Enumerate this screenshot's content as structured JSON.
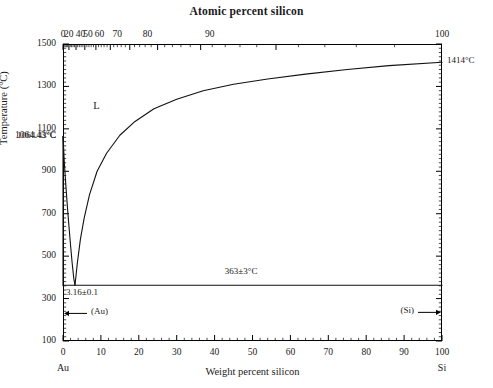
{
  "figure": {
    "title_top": "Atomic percent silicon",
    "title_bottom": "Weight percent silicon",
    "y_axis_title": "Temperature (°C)",
    "left_component": "Au",
    "right_component": "Si"
  },
  "annotations": {
    "liquid_phase": "L",
    "au_melting_point": "1064.43°C",
    "si_melting_point": "1414°C",
    "eutectic_temperature": "363±3°C",
    "eutectic_composition": "3.16±0.1",
    "au_solid_phase": "(Au)",
    "si_solid_phase": "(Si)"
  },
  "axes": {
    "y_ticks": [
      "100",
      "300",
      "500",
      "700",
      "900",
      "1100",
      "1300",
      "1500"
    ],
    "y_special_label": "1064.43°C",
    "y_min": 100,
    "y_max": 1500,
    "x_bottom_ticks": [
      "0",
      "10",
      "20",
      "30",
      "40",
      "50",
      "60",
      "70",
      "80",
      "90",
      "100"
    ],
    "x_bottom_min": 0,
    "x_bottom_max": 100,
    "x_top_ticks": [
      "0",
      "20",
      "40",
      "50",
      "60",
      "70",
      "80",
      "90",
      "100"
    ],
    "x_top_tick_weightpct": [
      0,
      1.5,
      4.6,
      6.6,
      9.6,
      14.3,
      22.3,
      38.7,
      100
    ]
  },
  "chart_data": {
    "type": "line",
    "xlabel": "Weight percent silicon",
    "ylabel": "Temperature (°C)",
    "xlim": [
      0,
      100
    ],
    "ylim": [
      100,
      1500
    ],
    "grid": false,
    "legend": null,
    "secondary_xaxis": {
      "label": "Atomic percent silicon",
      "ticks": [
        0,
        20,
        40,
        50,
        60,
        70,
        80,
        90,
        100
      ],
      "tick_positions_weightpct": [
        0,
        1.5,
        4.6,
        6.6,
        9.6,
        14.3,
        22.3,
        38.7,
        100
      ]
    },
    "series": [
      {
        "name": "Au-rich liquidus",
        "x": [
          0.0,
          0.35,
          0.8,
          1.3,
          1.9,
          2.4,
          2.85,
          3.16
        ],
        "y": [
          1064.43,
          940,
          820,
          700,
          570,
          470,
          395,
          363
        ]
      },
      {
        "name": "Si-rich liquidus",
        "x": [
          3.16,
          3.8,
          4.6,
          5.6,
          7.0,
          9.0,
          11.5,
          15.0,
          19.0,
          24.0,
          30.0,
          37.0,
          45.0,
          54.0,
          64.0,
          75.0,
          86.0,
          100.0
        ],
        "y": [
          363,
          470,
          580,
          680,
          790,
          900,
          985,
          1070,
          1135,
          1195,
          1240,
          1280,
          1310,
          1335,
          1358,
          1380,
          1398,
          1414
        ]
      },
      {
        "name": "Eutectic horizontal (solidus)",
        "x": [
          0,
          100
        ],
        "y": [
          363,
          363
        ]
      },
      {
        "name": "(Au) solvus / Au terminal solubility",
        "x": [
          0,
          0
        ],
        "y": [
          363,
          1064.43
        ]
      }
    ],
    "invariant_points": [
      {
        "name": "Eutectic",
        "x": 3.16,
        "y": 363,
        "label": "363±3°C, 3.16±0.1 wt% Si"
      },
      {
        "name": "Au melting point",
        "x": 0,
        "y": 1064.43,
        "label": "1064.43°C"
      },
      {
        "name": "Si melting point",
        "x": 100,
        "y": 1414,
        "label": "1414°C"
      }
    ],
    "phase_fields": [
      "L",
      "(Au)",
      "(Si)"
    ]
  }
}
